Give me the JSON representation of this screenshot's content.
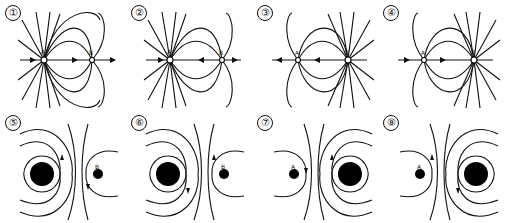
{
  "figure": {
    "panels": [
      {
        "id": "1",
        "label": "①",
        "type": "electric",
        "charge_a": "A",
        "charge_b": "B",
        "stronger": "A",
        "direction": "outward from A"
      },
      {
        "id": "2",
        "label": "②",
        "type": "electric",
        "charge_a": "A",
        "charge_b": "B",
        "stronger": "A",
        "direction": "inward to A"
      },
      {
        "id": "3",
        "label": "③",
        "type": "electric",
        "charge_a": "A",
        "charge_b": "B",
        "stronger": "B",
        "direction": "outward from B"
      },
      {
        "id": "4",
        "label": "④",
        "type": "electric",
        "charge_a": "A",
        "charge_b": "B",
        "stronger": "B",
        "direction": "inward to B"
      },
      {
        "id": "5",
        "label": "⑤",
        "type": "equipotential",
        "charge_a": "A",
        "charge_b": "B",
        "stronger": "A"
      },
      {
        "id": "6",
        "label": "⑥",
        "type": "equipotential",
        "charge_a": "A",
        "charge_b": "B",
        "stronger": "A"
      },
      {
        "id": "7",
        "label": "⑦",
        "type": "equipotential",
        "charge_a": "A",
        "charge_b": "B",
        "stronger": "B"
      },
      {
        "id": "8",
        "label": "⑧",
        "type": "equipotential",
        "charge_a": "A",
        "charge_b": "B",
        "stronger": "B"
      }
    ]
  }
}
